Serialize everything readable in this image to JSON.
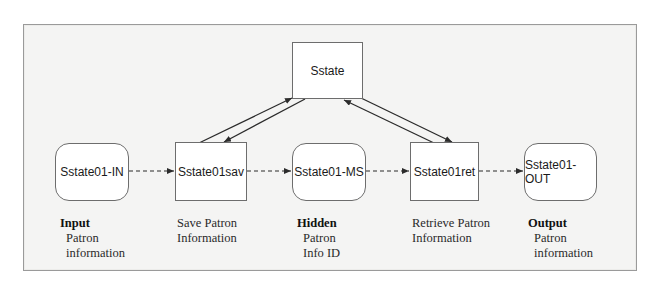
{
  "diagram": {
    "nodes": {
      "sstate": {
        "label": "Sstate",
        "shape": "rectangle"
      },
      "in": {
        "label": "Sstate01-IN",
        "shape": "rounded"
      },
      "sav": {
        "label": "Sstate01sav",
        "shape": "rectangle"
      },
      "ms": {
        "label": "Sstate01-MS",
        "shape": "rounded"
      },
      "ret": {
        "label": "Sstate01ret",
        "shape": "rectangle"
      },
      "out": {
        "label": "Sstate01-OUT",
        "shape": "rounded"
      }
    },
    "captions": {
      "in": {
        "title": "Input",
        "lines": [
          "Patron",
          "information"
        ]
      },
      "sav": {
        "title": "",
        "lines": [
          "Save Patron",
          "Information"
        ]
      },
      "ms": {
        "title": "Hidden",
        "lines": [
          "Patron",
          "Info ID"
        ]
      },
      "ret": {
        "title": "",
        "lines": [
          "Retrieve Patron",
          "Information"
        ]
      },
      "out": {
        "title": "Output",
        "lines": [
          "Patron",
          "information"
        ]
      }
    },
    "edges": [
      {
        "from": "in",
        "to": "sav",
        "style": "dashed"
      },
      {
        "from": "sav",
        "to": "ms",
        "style": "dashed"
      },
      {
        "from": "ms",
        "to": "ret",
        "style": "dashed"
      },
      {
        "from": "ret",
        "to": "out",
        "style": "dashed"
      },
      {
        "from": "sav",
        "to": "sstate",
        "style": "solid"
      },
      {
        "from": "sstate",
        "to": "sav",
        "style": "solid"
      },
      {
        "from": "ret",
        "to": "sstate",
        "style": "solid"
      },
      {
        "from": "sstate",
        "to": "ret",
        "style": "solid"
      }
    ],
    "colors": {
      "line": "#2b2b2b",
      "node_border": "#6d6d6d",
      "background": "#f4f4f3"
    }
  }
}
